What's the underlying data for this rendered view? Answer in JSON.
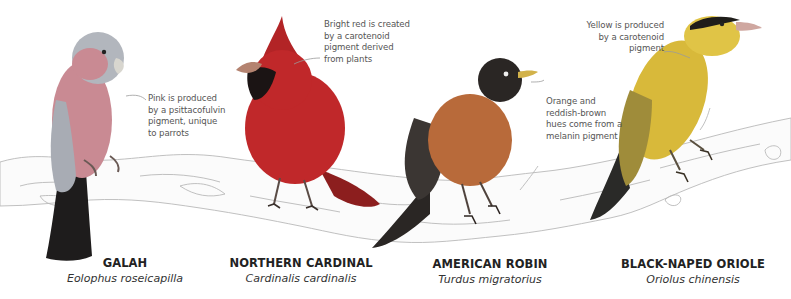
{
  "colors": {
    "galah_pink": "#c98a93",
    "galah_gray": "#9a9ea6",
    "cardinal_red": "#c0282a",
    "robin_orange": "#b86a3a",
    "robin_black": "#2a2624",
    "oriole_yellow": "#d8b93a",
    "oriole_black": "#1f1d1a",
    "branch_outline": "#b9b9b9",
    "callout_line": "#9a9a9a",
    "text_dark": "#222222"
  },
  "birds": [
    {
      "common_name": "GALAH",
      "scientific_name": "Eolophus roseicapilla",
      "callout": [
        "Pink is produced",
        "by a psittacofulvin",
        "pigment, unique",
        "to parrots"
      ]
    },
    {
      "common_name": "NORTHERN CARDINAL",
      "scientific_name": "Cardinalis cardinalis",
      "callout": [
        "Bright red is created",
        "by a carotenoid",
        "pigment derived",
        "from plants"
      ]
    },
    {
      "common_name": "AMERICAN ROBIN",
      "scientific_name": "Turdus migratorius",
      "callout": [
        "Orange and",
        "reddish-brown",
        "hues come from a",
        "melanin pigment"
      ]
    },
    {
      "common_name": "BLACK-NAPED ORIOLE",
      "scientific_name": "Oriolus chinensis",
      "callout": [
        "Yellow is produced",
        "by a carotenoid",
        "pigment"
      ]
    }
  ]
}
